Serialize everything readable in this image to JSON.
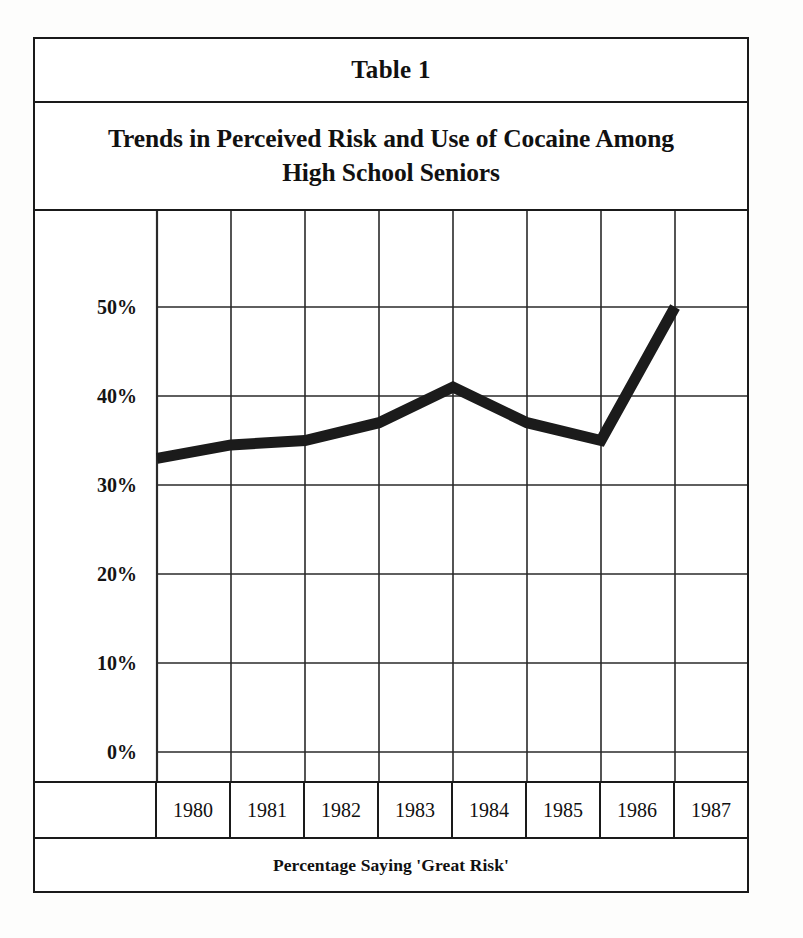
{
  "caption": "Table 1",
  "title": {
    "line1": "Trends in Perceived Risk and Use of Cocaine Among",
    "line2": "High School Seniors"
  },
  "footer": "Percentage Saying 'Great Risk'",
  "axis": {
    "y_ticks": [
      "50%",
      "40%",
      "30%",
      "20%",
      "10%",
      "0%"
    ],
    "x_first_cell": "",
    "x_labels": [
      "1980",
      "1981",
      "1982",
      "1983",
      "1984",
      "1985",
      "1986",
      "1987"
    ]
  },
  "colors": {
    "line": "#1b1b1b",
    "grid": "#2a2a2a",
    "border": "#1a1a1a",
    "background": "#ffffff"
  },
  "chart_data": {
    "type": "line",
    "title": "Trends in Perceived Risk and Use of Cocaine Among High School Seniors",
    "subtitle": "Table 1",
    "xlabel": "Percentage Saying 'Great Risk'",
    "ylabel": "",
    "categories": [
      "1980",
      "1981",
      "1982",
      "1983",
      "1984",
      "1985",
      "1986",
      "1987"
    ],
    "values": [
      33,
      34.5,
      35,
      37,
      41,
      37,
      35,
      50
    ],
    "series": [
      {
        "name": "Percentage Saying 'Great Risk'",
        "values": [
          33,
          34.5,
          35,
          37,
          41,
          37,
          35,
          50
        ]
      }
    ],
    "ylim": [
      -10,
      60
    ],
    "ytick_values": [
      50,
      40,
      30,
      20,
      10,
      0
    ],
    "ytick_labels": [
      "50%",
      "40%",
      "30%",
      "20%",
      "10%",
      "0%"
    ],
    "grid": true,
    "legend": false,
    "line_style": "thick-solid-black"
  }
}
